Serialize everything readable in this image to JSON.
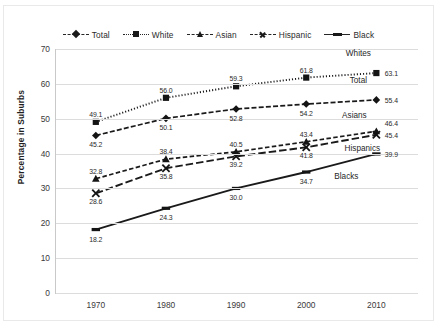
{
  "chart_data": {
    "type": "line",
    "title": "",
    "xlabel": "",
    "ylabel": "Percentage in Suburbs",
    "x": [
      1970,
      1980,
      1990,
      2000,
      2010
    ],
    "xtick_labels": [
      "1970",
      "1980",
      "1990",
      "2000",
      "2010"
    ],
    "ytick_labels": [
      "0",
      "10",
      "20",
      "30",
      "40",
      "50",
      "60",
      "70"
    ],
    "yticks": [
      0,
      10,
      20,
      30,
      40,
      50,
      60,
      70
    ],
    "ylim": [
      0,
      70
    ],
    "grid": "horizontal",
    "legend_position": "top-center",
    "series": [
      {
        "name": "Total",
        "values": [
          45.2,
          50.1,
          52.8,
          54.2,
          55.4
        ],
        "labels": [
          "45.2",
          "50.1",
          "52.8",
          "54.2",
          "55.4"
        ],
        "marker": "diamond",
        "line_style": "dashdot",
        "end_annotation": "Total"
      },
      {
        "name": "White",
        "values": [
          49.1,
          56.0,
          59.3,
          61.8,
          63.1
        ],
        "labels": [
          "49.1",
          "56.0",
          "59.3",
          "61.8",
          "63.1"
        ],
        "marker": "square",
        "line_style": "dotted",
        "end_annotation": "Whites"
      },
      {
        "name": "Asian",
        "values": [
          32.8,
          38.4,
          40.5,
          43.4,
          46.4
        ],
        "labels": [
          "32.8",
          "38.4",
          "40.5",
          "43.4",
          "46.4"
        ],
        "marker": "triangle",
        "line_style": "dashed",
        "end_annotation": "Asians"
      },
      {
        "name": "Hispanic",
        "values": [
          28.6,
          35.8,
          39.2,
          41.8,
          45.4
        ],
        "labels": [
          "28.6",
          "35.8",
          "39.2",
          "41.8",
          "45.4"
        ],
        "marker": "x",
        "line_style": "longdash",
        "end_annotation": "Hispanics"
      },
      {
        "name": "Black",
        "values": [
          18.2,
          24.3,
          30.0,
          34.7,
          39.9
        ],
        "labels": [
          "18.2",
          "24.3",
          "30.0",
          "34.7",
          "39.9"
        ],
        "marker": "dash",
        "line_style": "solid",
        "end_annotation": "Blacks"
      }
    ],
    "colors": {
      "line": "#1a1a1a",
      "marker": "#141414",
      "gridline": "#dcdcdc",
      "axis": "#c9c9c9",
      "background": "#ffffff",
      "text": "#2b2b2b"
    }
  },
  "legend": {
    "items": [
      {
        "label": "Total",
        "marker": "diamond",
        "line_style": "dashdot"
      },
      {
        "label": "White",
        "marker": "square",
        "line_style": "dotted"
      },
      {
        "label": "Asian",
        "marker": "triangle",
        "line_style": "dashed"
      },
      {
        "label": "Hispanic",
        "marker": "x",
        "line_style": "longdash"
      },
      {
        "label": "Black",
        "marker": "dash",
        "line_style": "solid"
      }
    ]
  },
  "axis": {
    "y_title": "Percentage in Suburbs"
  }
}
